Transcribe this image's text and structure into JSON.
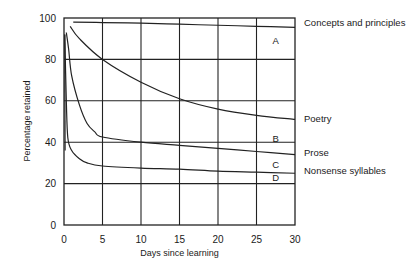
{
  "chart_data": {
    "type": "line",
    "title": "",
    "xlabel": "Days since learning",
    "ylabel": "Percentage retained",
    "xlim": [
      0,
      30
    ],
    "ylim": [
      0,
      100
    ],
    "x_ticks": [
      0,
      5,
      10,
      15,
      20,
      25,
      30
    ],
    "y_ticks": [
      0,
      20,
      40,
      60,
      80,
      100
    ],
    "grid": true,
    "legend_position": "right (direct labels at line ends)",
    "series": [
      {
        "name": "Concepts and principles",
        "letter": "A",
        "x": [
          1.2,
          5,
          10,
          15,
          20,
          25,
          30
        ],
        "values": [
          98,
          97.8,
          97.5,
          97,
          96.5,
          96,
          95.5
        ]
      },
      {
        "name": "Poetry",
        "letter": "B",
        "x": [
          0.8,
          2,
          5,
          10,
          15,
          20,
          25,
          30
        ],
        "values": [
          96,
          90,
          80,
          69,
          61,
          56,
          53,
          51
        ]
      },
      {
        "name": "Prose",
        "letter": "C",
        "x": [
          0.3,
          0.6,
          1,
          2,
          3,
          4,
          5,
          10,
          15,
          20,
          25,
          30
        ],
        "values": [
          93,
          85,
          72,
          58,
          49,
          45,
          42.5,
          40,
          38.5,
          37,
          35.5,
          34
        ]
      },
      {
        "name": "Nonsense syllables",
        "letter": "D",
        "x": [
          0.1,
          0.3,
          0.5,
          1,
          2,
          3,
          5,
          10,
          15,
          20,
          25,
          30
        ],
        "values": [
          92,
          60,
          42,
          36,
          32,
          30,
          28.5,
          27.5,
          27,
          26,
          25.5,
          25
        ]
      }
    ],
    "annotations": [
      {
        "text": "A",
        "x": 27.5,
        "y": 89
      },
      {
        "text": "B",
        "x": 27.5,
        "y": 42
      },
      {
        "text": "C",
        "x": 27.5,
        "y": 29
      },
      {
        "text": "D",
        "x": 27.5,
        "y": 23
      }
    ]
  }
}
